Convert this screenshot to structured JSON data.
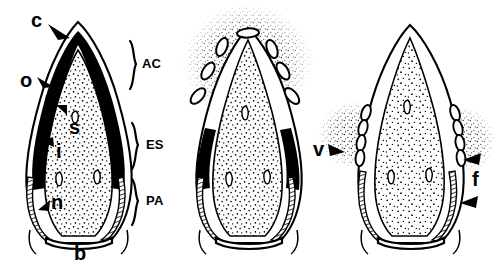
{
  "figure": {
    "type": "scientific-line-drawing",
    "panel_count": 3,
    "background_color": "#ffffff",
    "ink_color": "#000000"
  },
  "panels": [
    {
      "id": "panel-1",
      "order": 1,
      "caption": "intact structure with darkly stained outer layer",
      "center_x": 78,
      "features": [
        "apical cap",
        "dark outer wall",
        "stippled central mass",
        "hatched basal flanks",
        "basal plate"
      ]
    },
    {
      "id": "panel-2",
      "order": 2,
      "caption": "apical discharge of spores with scattered debris cloud",
      "center_x": 248,
      "features": [
        "ruptured apex",
        "released spores",
        "speckle cloud",
        "residual dark lateral wall"
      ]
    },
    {
      "id": "panel-3",
      "order": 3,
      "caption": "lateral discharge of spores along flanks",
      "center_x": 410,
      "features": [
        "intact apex",
        "lateral spore rows",
        "speckle cloud",
        "hatched flanks"
      ]
    }
  ],
  "labels": {
    "lowercase": [
      {
        "key": "c",
        "text": "c",
        "meaning": "apical cap",
        "x": 31,
        "y": 10,
        "panel": "panel-1"
      },
      {
        "key": "o",
        "text": "o",
        "meaning": "outer wall layer",
        "x": 20,
        "y": 70,
        "panel": "panel-1"
      },
      {
        "key": "s",
        "text": "s",
        "meaning": "spore mass",
        "x": 69,
        "y": 117,
        "panel": "panel-1"
      },
      {
        "key": "i",
        "text": "i",
        "meaning": "inner wall layer",
        "x": 56,
        "y": 141,
        "panel": "panel-1"
      },
      {
        "key": "n",
        "text": "n",
        "meaning": "nucleus",
        "x": 51,
        "y": 192,
        "panel": "panel-1"
      },
      {
        "key": "b",
        "text": "b",
        "meaning": "basal plate",
        "x": 74,
        "y": 243,
        "panel": "panel-1"
      },
      {
        "key": "v",
        "text": "v",
        "meaning": "vesicle / lateral opening",
        "x": 313,
        "y": 139,
        "panel": "panel-3"
      },
      {
        "key": "f",
        "text": "f",
        "meaning": "fibrillar layer",
        "x": 472,
        "y": 169,
        "panel": "panel-3"
      }
    ],
    "regions": [
      {
        "key": "AC",
        "text": "AC",
        "meaning": "apical complex",
        "x": 142,
        "y": 57,
        "bracket_top": 40,
        "bracket_bottom": 90
      },
      {
        "key": "ES",
        "text": "ES",
        "meaning": "endospore region",
        "x": 146,
        "y": 142,
        "bracket_top": 122,
        "bracket_bottom": 172
      },
      {
        "key": "PA",
        "text": "PA",
        "meaning": "perisporal apparatus",
        "x": 146,
        "y": 198,
        "bracket_top": 178,
        "bracket_bottom": 228
      }
    ]
  }
}
